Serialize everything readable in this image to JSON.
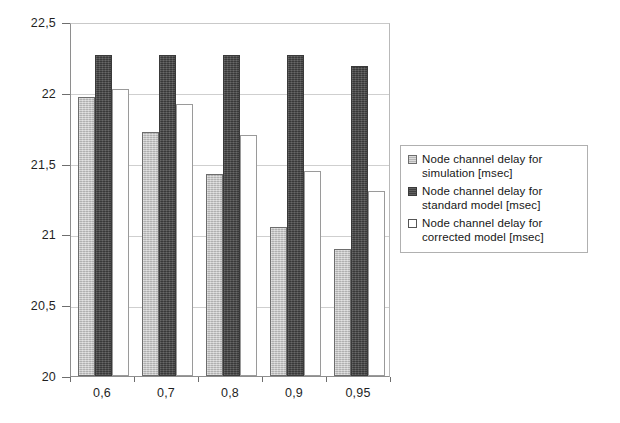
{
  "chart_data": {
    "type": "bar",
    "title": "",
    "xlabel": "",
    "ylabel": "",
    "ylim": [
      20,
      22.5
    ],
    "ytick_labels": [
      "22,5",
      "22",
      "21,5",
      "21",
      "20,5",
      "20"
    ],
    "ytick_values": [
      22.5,
      22,
      21.5,
      21,
      20.5,
      20
    ],
    "grid": true,
    "legend_position": "right",
    "categories": [
      "0,6",
      "0,7",
      "0,8",
      "0,9",
      "0,95"
    ],
    "category_values": [
      0.6,
      0.7,
      0.8,
      0.9,
      0.95
    ],
    "series": [
      {
        "name": "Node channel delay for\nsimulation [msec]",
        "color": "#c3c3c3",
        "values": [
          21.97,
          21.72,
          21.43,
          21.05,
          20.9
        ]
      },
      {
        "name": "Node channel delay for\nstandard model [msec]",
        "color": "#4b4b4b",
        "values": [
          22.27,
          22.27,
          22.27,
          22.27,
          22.19
        ]
      },
      {
        "name": "Node channel delay for\ncorrected model [msec]",
        "color": "#ffffff",
        "values": [
          22.03,
          21.92,
          21.7,
          21.45,
          21.31
        ]
      }
    ]
  }
}
